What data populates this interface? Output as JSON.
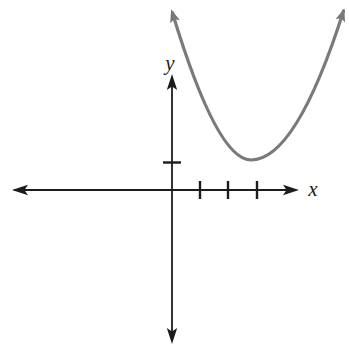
{
  "figure_title": "Graph of an upward-opening parabola",
  "chart_data": {
    "type": "line",
    "title": "",
    "xlabel": "x",
    "ylabel": "y",
    "grid": false,
    "legend": false,
    "xlim": [
      -5.6,
      4.4
    ],
    "ylim": [
      -5.7,
      4.3
    ],
    "x_ticks": [
      1,
      2,
      3
    ],
    "y_ticks": [
      1
    ],
    "tick_labels_shown": false,
    "series": [
      {
        "name": "parabola",
        "description": "Upward-opening parabola with vertex in the first quadrant near (2.8, 1.1); approximately y = 0.57(x - 2.8)^2 + 1.1, drawn with arrows on both ends",
        "points": [
          [
            0,
            6.0
          ],
          [
            1,
            3.1
          ],
          [
            2,
            1.5
          ],
          [
            2.8,
            1.1
          ],
          [
            4,
            1.9
          ],
          [
            5,
            3.6
          ],
          [
            6,
            6.6
          ]
        ]
      }
    ]
  },
  "style": {
    "background": "#ffffff",
    "axis_color": "#1c1c1c",
    "curve_color": "#7a7a7a",
    "curve_arrow_color": "#737373"
  },
  "render": {
    "canvas": {
      "width": 349,
      "height": 345
    },
    "axis_stroke": 1.8,
    "tick_stroke": 2.4,
    "tick_half": 9,
    "axis_arrow": {
      "length": 16,
      "half_width": 5.2
    },
    "x_axis": {
      "y": 190,
      "x1": 14,
      "x2": 296,
      "ticks": [
        200,
        228,
        257
      ],
      "arrows": [
        {
          "tip": [
            12,
            190
          ],
          "angle": 180
        },
        {
          "tip": [
            299,
            190
          ],
          "angle": 0
        }
      ]
    },
    "y_axis": {
      "x": 172,
      "y1": 77,
      "y2": 341,
      "ticks": [
        162.5
      ],
      "arrows": [
        {
          "tip": [
            172,
            74
          ],
          "angle": -90
        },
        {
          "tip": [
            172,
            344
          ],
          "angle": 90
        }
      ]
    },
    "curve": {
      "stroke_width": 3.2,
      "start": [
        172.5,
        13
      ],
      "quad_segments": [
        [
          217,
          160,
          251,
          160
        ],
        [
          296,
          160,
          343.5,
          11
        ]
      ],
      "arrow": {
        "length": 13,
        "half_width": 5
      },
      "arrows": [
        {
          "tip": [
            171.2,
            9.3
          ],
          "angle": -107
        },
        {
          "tip": [
            344.3,
            8.5
          ],
          "angle": -72
        }
      ]
    }
  }
}
